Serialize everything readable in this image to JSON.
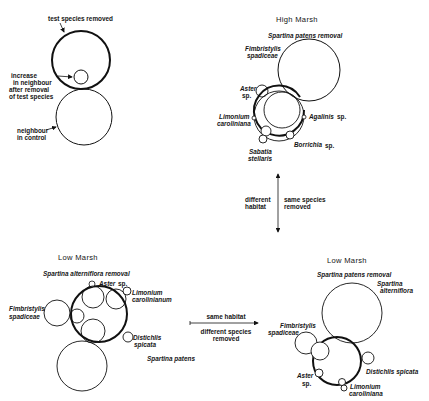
{
  "legend": {
    "test_species_removed": "test species removed",
    "increase_line1": "increase",
    "increase_line2": "in neighbour",
    "increase_line3": "after removal",
    "increase_line4": "of test species",
    "neighbour_line1": "neighbour",
    "neighbour_line2": "in control"
  },
  "high_marsh": {
    "title": "High Marsh",
    "removal": "Spartina patens removal",
    "fimbristylis_1": "Fimbristylis",
    "fimbristylis_2": "spadiceae",
    "aster_1": "Aster",
    "aster_2": "sp.",
    "limonium_1": "Limonium",
    "limonium_2": "caroliniana",
    "agalinis": "Agalinis",
    "agalinis_sp": "sp.",
    "borrichia": "Borrichia",
    "borrichia_sp": "sp.",
    "sabatia_1": "Sabatia",
    "sabatia_2": "stellaris"
  },
  "vertical_arrow": {
    "left_1": "different",
    "left_2": "habitat",
    "right_1": "same species",
    "right_2": "removed"
  },
  "low_marsh_left": {
    "title": "Low Marsh",
    "removal": "Spartina alterniflora removal",
    "aster": "Aster",
    "aster_sp": "sp.",
    "limonium_1": "Limonium",
    "limonium_2": "carolinianum",
    "fimbristylis_1": "Fimbristylis",
    "fimbristylis_2": "spadiceae",
    "distichlis_1": "Distichlis",
    "distichlis_2": "spicata",
    "spartina_patens": "Spartina patens"
  },
  "horizontal_arrow": {
    "top": "same habitat",
    "bottom_1": "different species",
    "bottom_2": "removed"
  },
  "low_marsh_right": {
    "title": "Low Marsh",
    "removal": "Spartina patens removal",
    "spartina_1": "Spartina",
    "spartina_2": "alterniflora",
    "fimbristylis_1": "Fimbristylis",
    "fimbristylis_2": "spadiceae",
    "distichlis": "Distichlis spicata",
    "aster_1": "Aster",
    "aster_2": "sp.",
    "limonium_1": "Limonium",
    "limonium_2": "caroliniana"
  }
}
